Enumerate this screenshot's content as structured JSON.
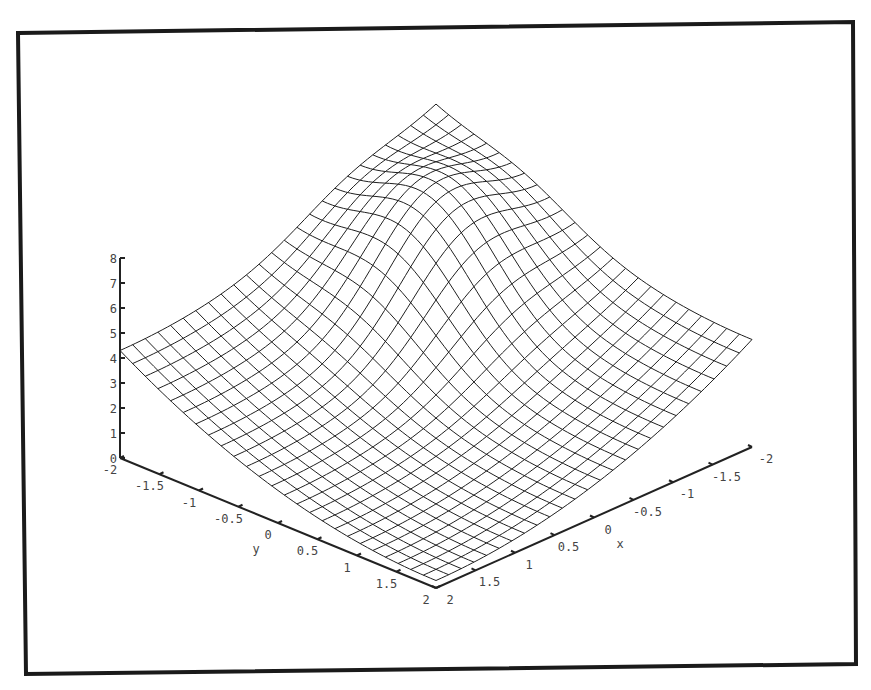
{
  "chart_data": {
    "type": "surface",
    "title": "",
    "xlabel": "x",
    "ylabel": "y",
    "zlabel": "",
    "x_range": [
      -2,
      2
    ],
    "y_range": [
      -2,
      2
    ],
    "z_range": [
      0,
      8
    ],
    "x_ticks": [
      "-2",
      "-1.5",
      "-1",
      "-0.5",
      "0",
      "0.5",
      "1",
      "1.5",
      "2"
    ],
    "y_ticks": [
      "-2",
      "-1.5",
      "-1",
      "-0.5",
      "0",
      "0.5",
      "1",
      "1.5",
      "2"
    ],
    "z_ticks": [
      "0",
      "1",
      "2",
      "3",
      "4",
      "5",
      "6",
      "7",
      "8"
    ],
    "grid_resolution": 25,
    "surface_description": "Wireframe mesh of a bowl-shaped surface rising toward the far corner, with a Gaussian-like hump peaking near z≈7.5",
    "sample_points": [
      {
        "x": 2,
        "y": -2,
        "z": 4
      },
      {
        "x": -2,
        "y": 2,
        "z": 4
      },
      {
        "x": -2,
        "y": -2,
        "z": 8
      },
      {
        "x": 2,
        "y": 2,
        "z": 0.6
      },
      {
        "x": 0,
        "y": 0,
        "z": 0.5
      }
    ]
  },
  "colors": {
    "frame": "#1a1a1a",
    "mesh": "#1f1f1f",
    "axes": "#222222",
    "labels": "#444444"
  }
}
